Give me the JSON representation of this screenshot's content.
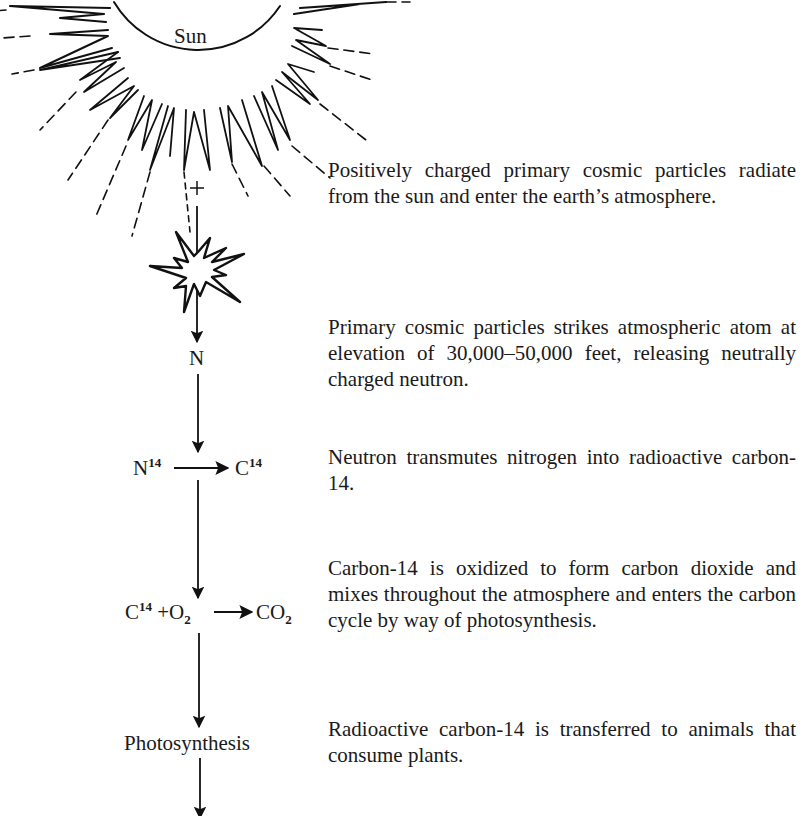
{
  "diagram": {
    "type": "flow",
    "direction": "top-to-bottom",
    "source": {
      "label": "Sun",
      "icon": "sun-icon"
    },
    "charge_symbol": "+",
    "collision": {
      "icon": "starburst-collision-icon"
    },
    "nodes": [
      {
        "id": "neutron",
        "label": "N"
      },
      {
        "id": "transmutation",
        "left": "N",
        "left_sup": "14",
        "right": "C",
        "right_sup": "14"
      },
      {
        "id": "oxidation",
        "c": "C",
        "c_sup": "14",
        "plus_o": " +O",
        "o_sub": "2",
        "co": "CO",
        "co_sub": "2"
      },
      {
        "id": "photosynthesis",
        "label": "Photosynthesis"
      }
    ],
    "descriptions": [
      "Positively charged primary cosmic particles radiate from the sun and enter the earth’s atmosphere.",
      "Primary cosmic particles strikes atmospheric atom at elevation of 30,000–50,000 feet, re­leasing neutrally charged neutron.",
      "Neutron transmutes nitrogen into radioactive carbon-14.",
      "Carbon-14 is oxidized to form carbon dioxide and mixes throughout the atmosphere and enters the carbon cycle by way of photo­synthesis.",
      "Radioactive carbon-14 is transferred to ani­mals that consume plants."
    ]
  }
}
